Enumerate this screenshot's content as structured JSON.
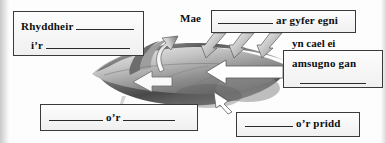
{
  "worksheet": {
    "language": "cy",
    "boxes": {
      "release": {
        "line1_text": "Rhyddheir",
        "line1_blank": "__________",
        "line2_text": "i’r",
        "line2_blank": "______________"
      },
      "energy": {
        "blank": "________",
        "text": "ar gyfer egni"
      },
      "absorb": {
        "text": "amsugno gan",
        "blank": "__________"
      },
      "water": {
        "blank_left": "_________",
        "text": "o’r",
        "blank_right": "_________"
      },
      "soil": {
        "blank": "________",
        "text": "o’r pridd"
      }
    },
    "labels": {
      "mae": "Mae",
      "yn_cael_ei": "yn cael ei"
    },
    "icons": {
      "leaf": "leaf-icon",
      "sunlight_arrows": "sunlight-arrow-icon",
      "absorb_arrow": "absorb-arrow-icon",
      "release_arrow": "release-arrow-icon",
      "uptake_arrow": "uptake-arrow-icon",
      "water_arrow": "water-arrow-icon"
    },
    "colors": {
      "box_border": "#3a3a3a",
      "text": "#0d0d0d",
      "leaf_dark": "#4a4a4a",
      "leaf_light": "#d5d5d5",
      "arrow_fill": "#ffffff",
      "page_background": "#fdfdfd"
    }
  }
}
